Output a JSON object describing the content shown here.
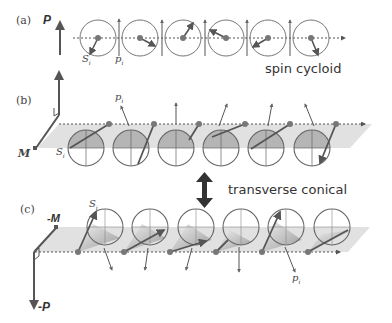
{
  "panels": {
    "a": {
      "label": "(a)",
      "polarization_label": "P",
      "spin_label": "S",
      "spin_sub": "i",
      "p_label": "p",
      "p_sub": "i",
      "caption": "spin cycloid"
    },
    "b": {
      "label": "(b)",
      "magnetization_label": "M",
      "spin_label": "S",
      "spin_sub": "i",
      "p_label": "p",
      "p_sub": "i"
    },
    "transition": {
      "caption": "transverse conical",
      "arrow": "double-headed-vertical-arrow"
    },
    "c": {
      "label": "(c)",
      "magnetization_label": "-M",
      "polarization_label": "-P",
      "spin_label": "S",
      "spin_sub": "i",
      "p_label": "p",
      "p_sub": "i"
    }
  },
  "colors": {
    "line": "#555555",
    "dot": "#6a6a6a",
    "plane": "#d9d9d9",
    "cone": "#a8a8a8",
    "text": "#333333"
  }
}
